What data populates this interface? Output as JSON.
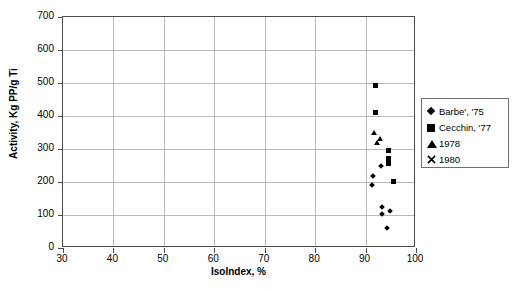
{
  "chart_data": {
    "type": "scatter",
    "title": "",
    "xlabel": "IsoIndex, %",
    "ylabel": "Activity, Kg PP/g Ti",
    "xlim": [
      30,
      100
    ],
    "ylim": [
      0,
      700
    ],
    "xticks": [
      30,
      40,
      50,
      60,
      70,
      80,
      90,
      100
    ],
    "yticks": [
      0,
      100,
      200,
      300,
      400,
      500,
      600,
      700
    ],
    "grid": true,
    "legend_position": "right",
    "series": [
      {
        "name": "Barbe', '75",
        "marker": "diamond",
        "color": "#000000",
        "points": [
          [
            91.5,
            217
          ],
          [
            93.0,
            248
          ],
          [
            91.3,
            192
          ],
          [
            93.3,
            125
          ],
          [
            93.2,
            102
          ],
          [
            94.8,
            112
          ],
          [
            94.2,
            60
          ]
        ]
      },
      {
        "name": "Cecchin, '77",
        "marker": "square",
        "color": "#000000",
        "points": [
          [
            92.0,
            493
          ],
          [
            92.0,
            412
          ],
          [
            94.5,
            295
          ],
          [
            94.5,
            272
          ],
          [
            94.5,
            255
          ],
          [
            95.5,
            203
          ]
        ]
      },
      {
        "name": "1978",
        "marker": "triangle",
        "color": "#000000",
        "points": [
          [
            91.8,
            348
          ],
          [
            92.8,
            330
          ],
          [
            92.3,
            318
          ]
        ]
      },
      {
        "name": "1980",
        "marker": "cross",
        "color": "#000000",
        "points": []
      }
    ]
  },
  "legend": {
    "items": [
      {
        "label": "Barbe', '75",
        "marker": "diamond"
      },
      {
        "label": "Cecchin, '77",
        "marker": "square"
      },
      {
        "label": "1978",
        "marker": "triangle"
      },
      {
        "label": "1980",
        "marker": "cross"
      }
    ]
  },
  "axes": {
    "x_title": "IsoIndex, %",
    "y_title": "Activity, Kg PP/g Ti"
  }
}
